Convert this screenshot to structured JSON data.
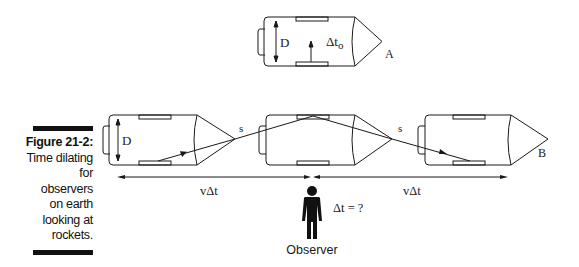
{
  "caption": {
    "figure_label": "Figure 21-2:",
    "lines": [
      "Time dilating",
      "for",
      "observers",
      "on earth",
      "looking at",
      "rockets."
    ]
  },
  "diagram": {
    "rest_frame_rocket": {
      "height_label": "D",
      "time_label_main": "Δt",
      "time_label_sub": "o",
      "name": "A"
    },
    "moving_rockets": {
      "height_label": "D",
      "path_label_1": "s",
      "path_label_2": "s",
      "name": "B"
    },
    "displacement_label_left": "vΔt",
    "displacement_label_right": "vΔt",
    "observer_time_label": "Δt = ?",
    "observer_label": "Observer"
  },
  "colors": {
    "ink": "#1a1a1a",
    "background": "#ffffff"
  }
}
